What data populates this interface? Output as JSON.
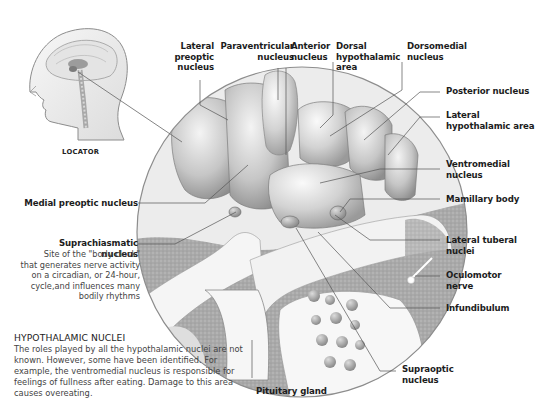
{
  "locator": {
    "label": "LOCATOR",
    "icon": "head-profile-with-brain"
  },
  "labels": {
    "lateral_preoptic": [
      "Lateral",
      "preoptic",
      "nucleus"
    ],
    "paraventricular": [
      "Paraventricular",
      "nucleus"
    ],
    "anterior": [
      "Anterior",
      "nucleus"
    ],
    "dorsal_hypothalamic": [
      "Dorsal",
      "hypothalamic",
      "area"
    ],
    "dorsomedial": [
      "Dorsomedial",
      "nucleus"
    ],
    "posterior": [
      "Posterior nucleus"
    ],
    "lateral_hypothalamic": [
      "Lateral",
      "hypothalamic area"
    ],
    "ventromedial": [
      "Ventromedial",
      "nucleus"
    ],
    "mamillary": [
      "Mamillary body"
    ],
    "lateral_tuberal": [
      "Lateral tuberal",
      "nuclei"
    ],
    "oculomotor": [
      "Oculomotor",
      "nerve"
    ],
    "infundibulum": [
      "Infundibulum"
    ],
    "supraoptic": [
      "Supraoptic",
      "nucleus"
    ],
    "pituitary": [
      "Pituitary gland"
    ],
    "medial_preoptic": [
      "Medial preoptic nucleus"
    ],
    "suprachiasmatic": [
      "Suprachiasmatic nucleus"
    ]
  },
  "suprachiasmatic_description": [
    "Site of the \"body clock\"",
    "that generates nerve activity",
    "on a circadian, or 24-hour,",
    "cycle,and influences many",
    "bodily rhythms"
  ],
  "section": {
    "title": "HYPOTHALAMIC NUCLEI",
    "body": "The roles played by all the hypothalamic nuclei are not known. However, some have been identified. For example, the ventromedial nucleus is responsible for feelings of fullness after eating. Damage to this area causes overeating."
  },
  "colors": {
    "background": "#ffffff",
    "label_text": "#1c1c1c",
    "body_text": "#444444",
    "leader_line": "#555555",
    "tissue_light": "#e6e6e6",
    "tissue_mid": "#b5b5b5",
    "tissue_dark": "#8a8a8a"
  }
}
